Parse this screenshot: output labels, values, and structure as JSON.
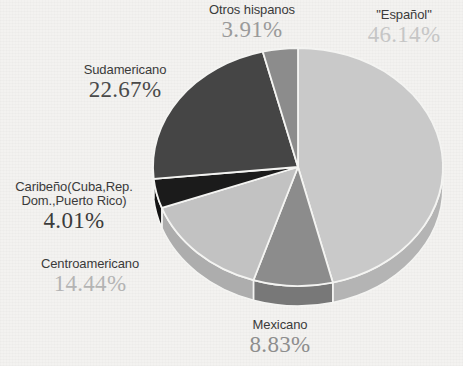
{
  "chart_data": {
    "type": "pie",
    "title": "",
    "subtitle": "",
    "xlabel": "",
    "ylabel": "",
    "legend_position": "none",
    "grid": false,
    "three_d": true,
    "units": "percent",
    "categories": [
      "\"Español\"",
      "Mexicano",
      "Centroamericano",
      "Caribeño(Cuba,Rep. Dom.,Puerto Rico)",
      "Sudamericano",
      "Otros hispanos"
    ],
    "values": [
      46.14,
      8.83,
      14.44,
      4.01,
      22.67,
      3.91
    ],
    "slices": [
      {
        "id": "espanol",
        "label": "\"Español\"",
        "label_line1": "\"Español\"",
        "label_line2": "",
        "value": 46.14,
        "value_text": "46.14%",
        "color": "#c9c9c9",
        "side_color": "#b4b4b4",
        "text_color": "#c6c6c6",
        "start_pct": 0,
        "end_pct": 46.14
      },
      {
        "id": "mexicano",
        "label": "Mexicano",
        "label_line1": "Mexicano",
        "label_line2": "",
        "value": 8.83,
        "value_text": "8.83%",
        "color": "#8c8c8c",
        "side_color": "#787878",
        "text_color": "#8d8d8d",
        "start_pct": 46.14,
        "end_pct": 54.97
      },
      {
        "id": "centroamericano",
        "label": "Centroamericano",
        "label_line1": "Centroamericano",
        "label_line2": "",
        "value": 14.44,
        "value_text": "14.44%",
        "color": "#c2c2c2",
        "side_color": "#adadad",
        "text_color": "#b4b4b4",
        "start_pct": 54.97,
        "end_pct": 69.41
      },
      {
        "id": "caribeno",
        "label": "Caribeño(Cuba,Rep. Dom.,Puerto Rico)",
        "label_line1": "Caribeño(Cuba,Rep.",
        "label_line2": "Dom.,Puerto Rico)",
        "value": 4.01,
        "value_text": "4.01%",
        "color": "#1b1b1b",
        "side_color": "#141414",
        "text_color": "#3b3b3b",
        "start_pct": 69.41,
        "end_pct": 73.42
      },
      {
        "id": "sudamericano",
        "label": "Sudamericano",
        "label_line1": "Sudamericano",
        "label_line2": "",
        "value": 22.67,
        "value_text": "22.67%",
        "color": "#454545",
        "side_color": "#343434",
        "text_color": "#4a4a4a",
        "start_pct": 73.42,
        "end_pct": 96.09
      },
      {
        "id": "otros",
        "label": "Otros hispanos",
        "label_line1": "Otros hispanos",
        "label_line2": "",
        "value": 3.91,
        "value_text": "3.91%",
        "color": "#8c8c8c",
        "side_color": "#787878",
        "text_color": "#9a9a9a",
        "start_pct": 96.09,
        "end_pct": 100
      }
    ],
    "background_color": "#f3f2f0",
    "separator_color": "#f4f4f2"
  },
  "labels": {
    "espanol": {
      "name": "\"Español\"",
      "pct": "46.14%"
    },
    "mexicano": {
      "name": "Mexicano",
      "pct": "8.83%"
    },
    "centroamericano": {
      "name": "Centroamericano",
      "pct": "14.44%"
    },
    "caribeno": {
      "name_line1": "Caribeño(Cuba,Rep.",
      "name_line2": "Dom.,Puerto Rico)",
      "pct": "4.01%"
    },
    "sudamericano": {
      "name": "Sudamericano",
      "pct": "22.67%"
    },
    "otros": {
      "name": "Otros hispanos",
      "pct": "3.91%"
    }
  }
}
